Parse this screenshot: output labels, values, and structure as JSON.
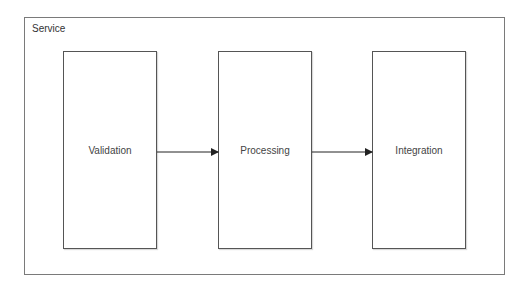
{
  "diagram": {
    "container": {
      "label": "Service"
    },
    "stages": [
      {
        "label": "Validation"
      },
      {
        "label": "Processing"
      },
      {
        "label": "Integration"
      }
    ],
    "edges": [
      {
        "from": "Validation",
        "to": "Processing"
      },
      {
        "from": "Processing",
        "to": "Integration"
      }
    ],
    "colors": {
      "stroke": "#555555",
      "text": "#444444",
      "background": "#ffffff"
    }
  }
}
